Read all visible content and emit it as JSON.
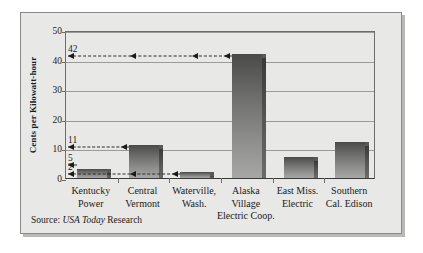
{
  "chart_data": {
    "type": "bar",
    "title": "",
    "xlabel": "",
    "ylabel": "Cents per Kilowatt-hour",
    "ylim": [
      0,
      50
    ],
    "yticks": [
      0,
      10,
      20,
      30,
      40,
      50
    ],
    "ytick_labels": [
      "0",
      "10",
      "20",
      "30",
      "40",
      "50"
    ],
    "grid": true,
    "legend": "none",
    "categories": [
      "Kentucky Power",
      "Central Vermont",
      "Waterville, Wash.",
      "Alaska Village Electric Coop.",
      "East Miss. Electric",
      "Southern Cal. Edison"
    ],
    "category_lines": [
      [
        "Kentucky",
        "Power",
        ""
      ],
      [
        "Central",
        "Vermont",
        ""
      ],
      [
        "Waterville,",
        "Wash.",
        ""
      ],
      [
        "Alaska",
        "Village",
        "Electric Coop."
      ],
      [
        "East Miss.",
        "Electric",
        ""
      ],
      [
        "Southern",
        "Cal. Edison",
        ""
      ]
    ],
    "values": [
      3,
      11,
      2,
      42,
      7,
      12
    ],
    "annotations": [
      {
        "label": "42",
        "value": 42,
        "from_category": "Alaska Village Electric Coop."
      },
      {
        "label": "11",
        "value": 11,
        "from_category": "Central Vermont"
      },
      {
        "label": "5",
        "value": 5,
        "from_category": "Kentucky Power"
      },
      {
        "label": "2",
        "value": 2,
        "from_category": "Waterville, Wash."
      }
    ]
  },
  "figure": {
    "source_prefix": "Source: ",
    "source_italic": "USA Today",
    "source_suffix": " Research"
  },
  "colors": {
    "background": "#e8e8e6",
    "frame": "#8a8a88",
    "axis": "#6d6d6b",
    "gridline": "#9a9a98",
    "bar_top": "#4a4a48",
    "bar_bottom": "#a7a7a5",
    "bar_side": "#555553",
    "text": "#1b1b1b",
    "annotation": "#1b1b1b"
  }
}
